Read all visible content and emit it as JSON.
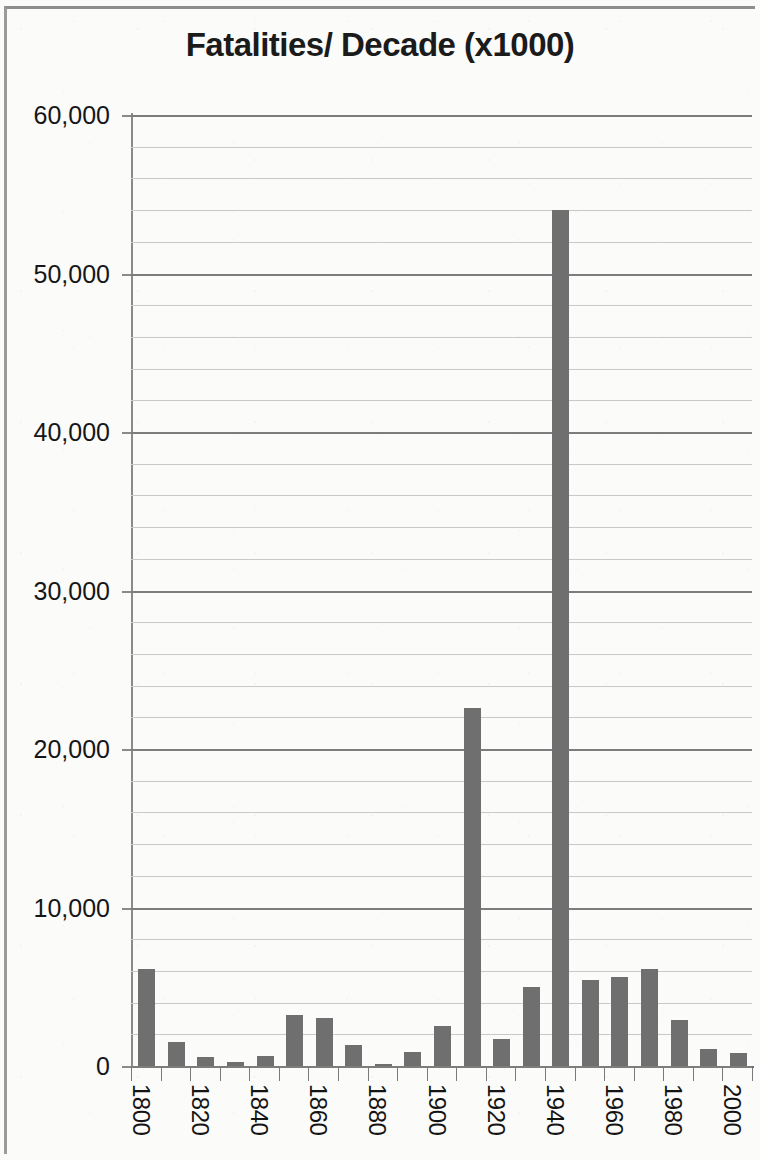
{
  "chart_data": {
    "type": "bar",
    "title": "Fatalities/ Decade (x1000)",
    "xlabel": "",
    "ylabel": "",
    "ylim": [
      0,
      60000
    ],
    "grid": true,
    "legend": null,
    "major_tick_step": 10000,
    "minor_tick_step": 2000,
    "y_tick_labels": [
      "60,000",
      "50,000",
      "40,000",
      "30,000",
      "20,000",
      "10,000",
      "0"
    ],
    "y_tick_values": [
      60000,
      50000,
      40000,
      30000,
      20000,
      10000,
      0
    ],
    "x_tick_labels": [
      "1800",
      "1820",
      "1840",
      "1860",
      "1880",
      "1900",
      "1920",
      "1940",
      "1960",
      "1980",
      "2000"
    ],
    "categories": [
      "1800",
      "1810",
      "1820",
      "1830",
      "1840",
      "1850",
      "1860",
      "1870",
      "1880",
      "1890",
      "1900",
      "1910",
      "1920",
      "1930",
      "1940",
      "1950",
      "1960",
      "1970",
      "1980",
      "1990",
      "2000"
    ],
    "values": [
      6100,
      1500,
      600,
      250,
      650,
      3200,
      3000,
      1300,
      100,
      900,
      2500,
      22600,
      1700,
      5000,
      54000,
      5400,
      5600,
      6100,
      2900,
      1100,
      800
    ],
    "bar_color": "#706f6f",
    "grid_color": "#c9c9c9",
    "axis_color": "#7d7d7d"
  }
}
